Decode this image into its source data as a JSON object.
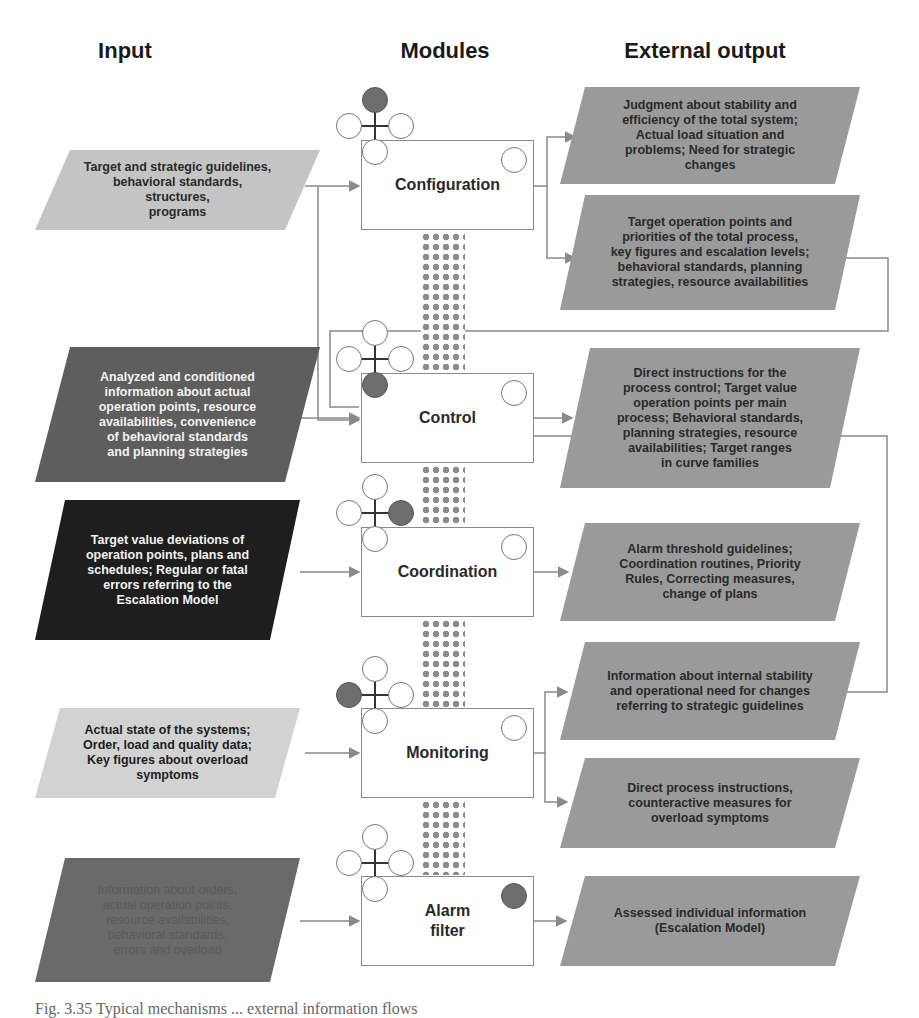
{
  "headers": {
    "input": "Input",
    "modules": "Modules",
    "output": "External output"
  },
  "colors": {
    "light_gray": "#c4c4c4",
    "mid_gray": "#9a9a9a",
    "dark_gray": "#5e5e5e",
    "black": "#1e1e1e",
    "line": "#8a8a8a",
    "filled_dot": "#6e6e6e"
  },
  "modules": [
    {
      "label": "Configuration",
      "cluster_filled": "top",
      "corner_filled": false
    },
    {
      "label": "Control",
      "cluster_filled": "bottom",
      "corner_filled": false
    },
    {
      "label": "Coordination",
      "cluster_filled": "right",
      "corner_filled": false
    },
    {
      "label": "Monitoring",
      "cluster_filled": "left",
      "corner_filled": false
    },
    {
      "label": "Alarm\nfilter",
      "cluster_filled": "none",
      "corner_filled": true
    }
  ],
  "inputs": [
    {
      "text": "Target and strategic guidelines,\nbehavioral standards, structures,\nprograms",
      "shade": "light_gray"
    },
    {
      "text": "Analyzed and conditioned\ninformation about actual\noperation points, resource\navailabilities, convenience\nof behavioral standards\nand planning strategies",
      "shade": "dark_gray"
    },
    {
      "text": "Target value deviations of\noperation points, plans and\nschedules; Regular or fatal\nerrors referring to the\nEscalation Model",
      "shade": "black"
    },
    {
      "text": "Actual state of the systems;\nOrder, load and quality data;\nKey figures about overload\nsymptoms",
      "shade": "light_gray"
    },
    {
      "text": "Information about orders,\nactual operation points,\nresource availabilities,\nbehavioral standards,\nerrors and overload",
      "shade": "dark_gray"
    }
  ],
  "outputs": [
    {
      "text": "Judgment about stability and\nefficiency of the total system;\nActual load situation and\nproblems; Need for strategic\nchanges",
      "module": "Configuration"
    },
    {
      "text": "Target operation points and\npriorities of the total process,\nkey figures and escalation levels;\nbehavioral standards, planning\nstrategies, resource availabilities",
      "module": "Configuration"
    },
    {
      "text": "Direct instructions for the\nprocess control; Target value\noperation points per main\nprocess; Behavioral standards,\nplanning strategies, resource\navailabilities; Target ranges\nin curve families",
      "module": "Control"
    },
    {
      "text": "Alarm threshold guidelines;\nCoordination routines, Priority\nRules, Correcting measures,\nchange of plans",
      "module": "Coordination"
    },
    {
      "text": "Information about internal stability\nand operational need for changes\nreferring to strategic guidelines",
      "module": "Monitoring"
    },
    {
      "text": "Direct process instructions,\ncounteractive measures for\noverload symptoms",
      "module": "Monitoring"
    },
    {
      "text": "Assessed individual information\n(Escalation Model)",
      "module": "Alarm filter"
    }
  ],
  "caption": "Fig. 3.35 Typical mechanisms ... external information flows"
}
